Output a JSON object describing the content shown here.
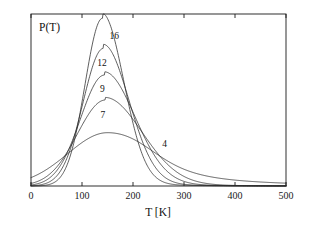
{
  "chart_data": {
    "type": "line",
    "title": "",
    "xlabel": "T [K]",
    "ylabel": "P(T)",
    "xlim": [
      0,
      500
    ],
    "ylim": [
      0,
      1.0
    ],
    "grid": false,
    "legend_position": "inline-curve-labels",
    "x_ticks": [
      {
        "value": 0,
        "label": "0"
      },
      {
        "value": 100,
        "label": "100"
      },
      {
        "value": 200,
        "label": "200"
      },
      {
        "value": 300,
        "label": "300"
      },
      {
        "value": 400,
        "label": "400"
      },
      {
        "value": 500,
        "label": "500"
      }
    ],
    "y_ticks": [],
    "series": [
      {
        "name": "16",
        "label": "16",
        "label_x": 163,
        "label_y": 0.855,
        "peak_x": 140,
        "peak_y": 0.975,
        "width_left": 34,
        "width_right": 42,
        "tail_right": 0.0
      },
      {
        "name": "12",
        "label": "12",
        "label_x": 139,
        "label_y": 0.7,
        "peak_x": 142,
        "peak_y": 0.8,
        "width_left": 40,
        "width_right": 50,
        "tail_right": 0.0
      },
      {
        "name": "9",
        "label": "9",
        "label_x": 140,
        "label_y": 0.545,
        "peak_x": 144,
        "peak_y": 0.645,
        "width_left": 47,
        "width_right": 60,
        "tail_right": 0.0
      },
      {
        "name": "7",
        "label": "7",
        "label_x": 141,
        "label_y": 0.395,
        "peak_x": 146,
        "peak_y": 0.5,
        "width_left": 55,
        "width_right": 72,
        "tail_right": 0.0
      },
      {
        "name": "4",
        "label": "4",
        "label_x": 262,
        "label_y": 0.225,
        "peak_x": 150,
        "peak_y": 0.31,
        "width_left": 78,
        "width_right": 120,
        "tail_right": 1.0
      }
    ],
    "annotations": [
      {
        "text": "16",
        "kind": "curve-label"
      },
      {
        "text": "12",
        "kind": "curve-label"
      },
      {
        "text": "9",
        "kind": "curve-label"
      },
      {
        "text": "7",
        "kind": "curve-label"
      },
      {
        "text": "4",
        "kind": "curve-label"
      }
    ]
  }
}
